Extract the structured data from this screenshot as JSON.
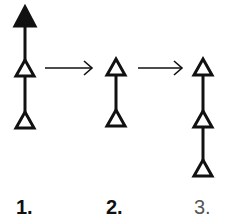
{
  "diagram": {
    "type": "transformation-sequence",
    "stroke_color": "#111111",
    "stages": [
      {
        "label": "1.",
        "nodes": [
          {
            "shape": "triangle",
            "fill": "filled"
          },
          {
            "shape": "triangle",
            "fill": "hollow"
          },
          {
            "shape": "triangle",
            "fill": "hollow"
          }
        ]
      },
      {
        "label": "2.",
        "nodes": [
          {
            "shape": "triangle",
            "fill": "hollow"
          },
          {
            "shape": "triangle",
            "fill": "hollow"
          }
        ]
      },
      {
        "label": "3.",
        "nodes": [
          {
            "shape": "triangle",
            "fill": "hollow"
          },
          {
            "shape": "triangle",
            "fill": "hollow"
          },
          {
            "shape": "triangle",
            "fill": "hollow"
          }
        ]
      }
    ],
    "transitions": [
      {
        "from": "1.",
        "to": "2.",
        "icon": "arrow-right-icon"
      },
      {
        "from": "2.",
        "to": "3.",
        "icon": "arrow-right-icon"
      }
    ]
  }
}
